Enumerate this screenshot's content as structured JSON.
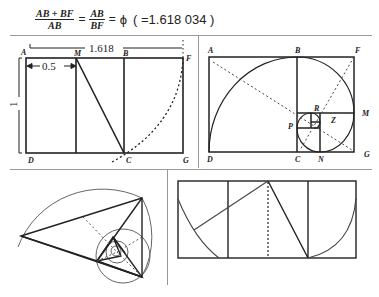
{
  "formula": {
    "frac1_num": "AB + BF",
    "frac1_den": "AB",
    "eq1": "=",
    "frac2_num": "AB",
    "frac2_den": "BF",
    "eq2": "=",
    "phi": "ϕ",
    "value": "( =1.618 034 )"
  },
  "panel_top_left": {
    "labels": {
      "A": "A",
      "M": "M",
      "B": "B",
      "F": "F",
      "D": "D",
      "C": "C",
      "G": "G"
    },
    "dim_width": "1.618",
    "dim_half": "0.5",
    "dim_height": "1"
  },
  "panel_top_right": {
    "labels": {
      "A": "A",
      "B": "B",
      "F": "F",
      "M": "M",
      "R": "R",
      "Z": "Z",
      "P": "P",
      "D": "D",
      "C": "C",
      "N": "N",
      "G": "G"
    }
  },
  "panel_bottom_left": {
    "description": "golden triangle spiral"
  },
  "panel_bottom_right": {
    "description": "golden rectangle construction"
  }
}
